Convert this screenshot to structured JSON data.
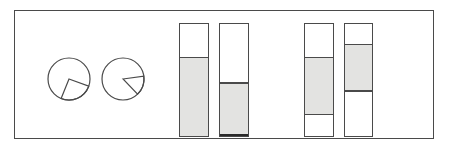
{
  "figure": {
    "title": "",
    "background_color": "#ffffff",
    "frame": {
      "x": 14,
      "y": 10,
      "width": 420,
      "height": 129,
      "stroke_color": "#4a4a4a",
      "stroke_width": 1.4,
      "fill_color": "#ffffff"
    },
    "stroke_color": "#4a4a4a",
    "fill_color": "#e3e3e1"
  },
  "chart_data": {
    "type": "pie",
    "title": "",
    "subtitle": "",
    "xlabel": "",
    "ylabel": "",
    "legend": [],
    "annotations": [],
    "grid": false,
    "pies": [
      {
        "name": "pie-1",
        "cx": 68,
        "cy": 78,
        "r": 21,
        "stroke_color": "#4a4a4a",
        "fill_color": "#ffffff",
        "wedge_start_deg": 20,
        "wedge_end_deg": 112,
        "wedge_span_deg": 92,
        "fraction": 0.256,
        "slices": [
          {
            "label": "",
            "value": 0.256,
            "filled": false
          },
          {
            "label": "",
            "value": 0.744,
            "filled": false
          }
        ]
      },
      {
        "name": "pie-2",
        "cx": 122,
        "cy": 78,
        "r": 21,
        "stroke_color": "#4a4a4a",
        "fill_color": "#ffffff",
        "wedge_start_deg": -8,
        "wedge_end_deg": 46,
        "wedge_span_deg": 54,
        "fraction": 0.15,
        "slices": [
          {
            "label": "",
            "value": 0.15,
            "filled": false
          },
          {
            "label": "",
            "value": 0.85,
            "filled": false
          }
        ]
      }
    ],
    "bars": [
      {
        "name": "bar-1",
        "x": 178,
        "y": 22,
        "width": 30,
        "height": 114,
        "heavy_base": false,
        "segments": [
          {
            "label": "",
            "from": 0.0,
            "to": 0.29,
            "filled": false
          },
          {
            "label": "",
            "from": 0.29,
            "to": 1.0,
            "filled": true
          }
        ]
      },
      {
        "name": "bar-2",
        "x": 218,
        "y": 22,
        "width": 30,
        "height": 114,
        "heavy_base": true,
        "segments": [
          {
            "label": "",
            "from": 0.0,
            "to": 0.51,
            "filled": false
          },
          {
            "label": "",
            "from": 0.51,
            "to": 1.0,
            "filled": true
          }
        ]
      },
      {
        "name": "bar-3",
        "x": 303,
        "y": 22,
        "width": 30,
        "height": 114,
        "heavy_base": false,
        "segments": [
          {
            "label": "",
            "from": 0.0,
            "to": 0.29,
            "filled": false
          },
          {
            "label": "",
            "from": 0.29,
            "to": 0.79,
            "filled": true
          },
          {
            "label": "",
            "from": 0.79,
            "to": 1.0,
            "filled": false
          }
        ]
      },
      {
        "name": "bar-4",
        "x": 343,
        "y": 22,
        "width": 29,
        "height": 114,
        "heavy_base": false,
        "segments": [
          {
            "label": "",
            "from": 0.0,
            "to": 0.175,
            "filled": false
          },
          {
            "label": "",
            "from": 0.175,
            "to": 0.58,
            "filled": true
          },
          {
            "label": "",
            "from": 0.58,
            "to": 1.0,
            "filled": false
          }
        ]
      }
    ]
  }
}
